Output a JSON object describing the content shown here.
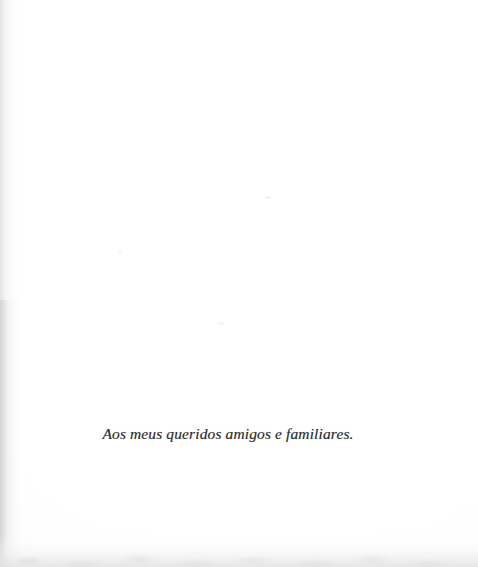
{
  "document": {
    "type": "scanned-book-page",
    "page_kind": "dedication",
    "language": "pt",
    "background_color": "#ffffff",
    "ink_color": "#2d2c2b"
  },
  "dedication": {
    "text": "Aos meus queridos amigos e familiares.",
    "style": "italic-serif",
    "alignment": "center"
  },
  "scan_artifacts": {
    "left_edge_label": "scan-gutter-shadow",
    "bottom_edge_label": "scan-trim-edge",
    "edge_tone": "#e4e4e4"
  }
}
